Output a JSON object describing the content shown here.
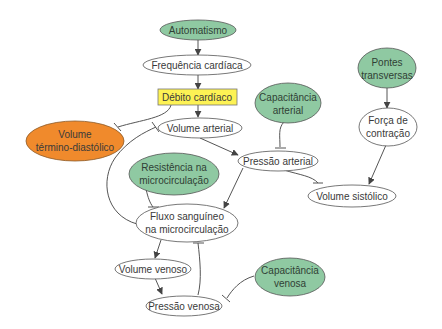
{
  "colors": {
    "green_fill": "#8fc9a2",
    "orange_fill": "#f08a2c",
    "yellow_fill": "#fdf254",
    "white_fill": "#ffffff",
    "stroke": "#555555",
    "edge": "#444444"
  },
  "nodes": {
    "automatismo": {
      "lines": [
        "Automatismo"
      ],
      "style": "green"
    },
    "frequencia": {
      "lines": [
        "Frequência cardíaca"
      ],
      "style": "white"
    },
    "debito": {
      "lines": [
        "Débito cardíaco"
      ],
      "style": "yellow-box"
    },
    "volume_termino": {
      "lines": [
        "Volume",
        "término-diastólico"
      ],
      "style": "orange"
    },
    "volume_arterial": {
      "lines": [
        "Volume arterial"
      ],
      "style": "white"
    },
    "capacitancia_arterial": {
      "lines": [
        "Capacitância",
        "arterial"
      ],
      "style": "green"
    },
    "pontes": {
      "lines": [
        "Pontes",
        "transversas"
      ],
      "style": "green"
    },
    "forca": {
      "lines": [
        "Força de",
        "contração"
      ],
      "style": "white"
    },
    "resistencia": {
      "lines": [
        "Resistência na",
        "microcirculação"
      ],
      "style": "green"
    },
    "pressao_arterial": {
      "lines": [
        "Pressão arterial"
      ],
      "style": "white"
    },
    "volume_sistolico": {
      "lines": [
        "Volume sistólico"
      ],
      "style": "white"
    },
    "fluxo": {
      "lines": [
        "Fluxo sanguíneo",
        "na microcirculação"
      ],
      "style": "white"
    },
    "volume_venoso": {
      "lines": [
        "Volume venoso"
      ],
      "style": "white"
    },
    "capacitancia_venosa": {
      "lines": [
        "Capacitância",
        "venosa"
      ],
      "style": "green"
    },
    "pressao_venosa": {
      "lines": [
        "Pressão venosa"
      ],
      "style": "white"
    }
  },
  "edges": [
    {
      "from": "Automatismo",
      "to": "Frequência cardíaca",
      "type": "activation"
    },
    {
      "from": "Frequência cardíaca",
      "to": "Débito cardíaco",
      "type": "activation"
    },
    {
      "from": "Débito cardíaco",
      "to": "Volume arterial",
      "type": "activation"
    },
    {
      "from": "Débito cardíaco",
      "to": "Volume término-diastólico",
      "type": "inhibition"
    },
    {
      "from": "Volume arterial",
      "to": "Pressão arterial",
      "type": "activation"
    },
    {
      "from": "Capacitância arterial",
      "to": "Pressão arterial",
      "type": "inhibition"
    },
    {
      "from": "Pontes transversas",
      "to": "Força de contração",
      "type": "activation"
    },
    {
      "from": "Força de contração",
      "to": "Volume sistólico",
      "type": "activation"
    },
    {
      "from": "Pressão arterial",
      "to": "Volume sistólico",
      "type": "inhibition"
    },
    {
      "from": "Pressão arterial",
      "to": "Fluxo sanguíneo na microcirculação",
      "type": "activation"
    },
    {
      "from": "Resistência na microcirculação",
      "to": "Fluxo sanguíneo na microcirculação",
      "type": "inhibition"
    },
    {
      "from": "Fluxo sanguíneo na microcirculação",
      "to": "Volume arterial",
      "type": "inhibition"
    },
    {
      "from": "Fluxo sanguíneo na microcirculação",
      "to": "Volume venoso",
      "type": "activation"
    },
    {
      "from": "Volume venoso",
      "to": "Pressão venosa",
      "type": "activation"
    },
    {
      "from": "Pressão venosa",
      "to": "Fluxo sanguíneo na microcirculação",
      "type": "inhibition"
    },
    {
      "from": "Capacitância venosa",
      "to": "Pressão venosa",
      "type": "inhibition"
    }
  ]
}
